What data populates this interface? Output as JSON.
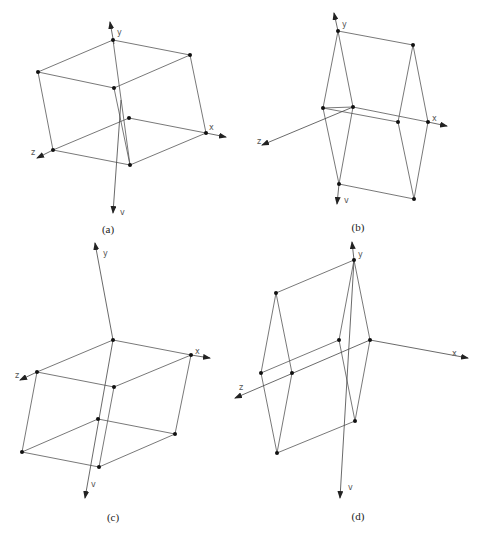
{
  "figure": {
    "panels": [
      {
        "id": "a",
        "caption": "(a)",
        "caption_pos": [
          108,
          233
        ],
        "axes": [
          {
            "name": "y",
            "label": "y",
            "from": [
              114,
              44
            ],
            "to": [
              110,
              22
            ],
            "label_pos": [
              117,
              35
            ]
          },
          {
            "name": "v",
            "label": "v",
            "from": [
              121,
              100
            ],
            "to": [
              113,
              213
            ],
            "label_pos": [
              120,
              215
            ]
          },
          {
            "name": "x",
            "label": "x",
            "from": [
              206,
              133
            ],
            "to": [
              226,
              137
            ],
            "label_pos": [
              209,
              130
            ]
          },
          {
            "name": "z",
            "label": "z",
            "from": [
              53,
              150
            ],
            "to": [
              37,
              158
            ],
            "label_pos": [
              31,
              155
            ]
          }
        ],
        "vertices": [
          [
            113,
            40
          ],
          [
            190,
            55
          ],
          [
            38,
            72
          ],
          [
            114,
            88
          ],
          [
            129,
            118
          ],
          [
            206,
            133
          ],
          [
            53,
            150
          ],
          [
            130,
            165
          ]
        ],
        "edges": [
          [
            0,
            1
          ],
          [
            0,
            2
          ],
          [
            1,
            3
          ],
          [
            2,
            3
          ],
          [
            4,
            5
          ],
          [
            4,
            6
          ],
          [
            5,
            7
          ],
          [
            6,
            7
          ],
          [
            0,
            7
          ],
          [
            1,
            5
          ],
          [
            2,
            6
          ],
          [
            3,
            7
          ]
        ]
      },
      {
        "id": "b",
        "caption": "(b)",
        "caption_pos": [
          358,
          231
        ],
        "axes": [
          {
            "name": "y",
            "label": "y",
            "from": [
              338,
              31
            ],
            "to": [
              334,
              13
            ],
            "label_pos": [
              342,
              27
            ]
          },
          {
            "name": "v",
            "label": "v",
            "from": [
              339,
              184
            ],
            "to": [
              337,
              204
            ],
            "label_pos": [
              344,
              203
            ]
          },
          {
            "name": "x",
            "label": "x",
            "from": [
              428,
              122
            ],
            "to": [
              447,
              126
            ],
            "label_pos": [
              432,
              121
            ]
          },
          {
            "name": "z",
            "label": "z",
            "from": [
              353,
              107
            ],
            "to": [
              262,
              145
            ],
            "label_pos": [
              257,
              144
            ]
          }
        ],
        "vertices": [
          [
            338,
            31
          ],
          [
            413,
            45
          ],
          [
            323,
            108
          ],
          [
            353,
            107
          ],
          [
            398,
            122
          ],
          [
            428,
            122
          ],
          [
            339,
            184
          ],
          [
            414,
            199
          ]
        ],
        "edges": [
          [
            0,
            1
          ],
          [
            0,
            2
          ],
          [
            0,
            3
          ],
          [
            1,
            4
          ],
          [
            1,
            5
          ],
          [
            2,
            3
          ],
          [
            2,
            6
          ],
          [
            3,
            6
          ],
          [
            2,
            4
          ],
          [
            3,
            5
          ],
          [
            4,
            7
          ],
          [
            5,
            7
          ],
          [
            6,
            7
          ]
        ]
      },
      {
        "id": "c",
        "caption": "(c)",
        "caption_pos": [
          113,
          521
        ],
        "axes": [
          {
            "name": "y",
            "label": "y",
            "from": [
              113,
              340
            ],
            "to": [
              95,
              243
            ],
            "label_pos": [
              103,
              256
            ]
          },
          {
            "name": "v",
            "label": "v",
            "from": [
              113,
              340
            ],
            "to": [
              85,
              498
            ],
            "label_pos": [
              91,
              487
            ]
          },
          {
            "name": "x",
            "label": "x",
            "from": [
              191,
              355
            ],
            "to": [
              210,
              358
            ],
            "label_pos": [
              195,
              354
            ]
          },
          {
            "name": "z",
            "label": "z",
            "from": [
              37,
              372
            ],
            "to": [
              20,
              380
            ],
            "label_pos": [
              15,
              378
            ]
          }
        ],
        "vertices": [
          [
            113,
            340
          ],
          [
            191,
            355
          ],
          [
            37,
            372
          ],
          [
            114,
            387
          ],
          [
            98,
            419
          ],
          [
            175,
            434
          ],
          [
            22,
            452
          ],
          [
            99,
            467
          ]
        ],
        "edges": [
          [
            0,
            1
          ],
          [
            0,
            2
          ],
          [
            1,
            3
          ],
          [
            2,
            3
          ],
          [
            4,
            5
          ],
          [
            4,
            6
          ],
          [
            5,
            7
          ],
          [
            6,
            7
          ],
          [
            1,
            5
          ],
          [
            2,
            6
          ],
          [
            3,
            7
          ]
        ]
      },
      {
        "id": "d",
        "caption": "(d)",
        "caption_pos": [
          358,
          520
        ],
        "axes": [
          {
            "name": "y",
            "label": "y",
            "from": [
              354,
              260
            ],
            "to": [
              352,
              242
            ],
            "label_pos": [
              358,
              257
            ]
          },
          {
            "name": "v",
            "label": "v",
            "from": [
              354,
              260
            ],
            "to": [
              340,
              498
            ],
            "label_pos": [
              348,
              490
            ]
          },
          {
            "name": "x",
            "label": "x",
            "from": [
              370,
              340
            ],
            "to": [
              468,
              358
            ],
            "label_pos": [
              452,
              356
            ]
          },
          {
            "name": "z",
            "label": "z",
            "from": [
              370,
              340
            ],
            "to": [
              235,
              398
            ],
            "label_pos": [
              239,
              390
            ]
          }
        ],
        "vertices": [
          [
            354,
            260
          ],
          [
            276,
            293
          ],
          [
            339,
            340
          ],
          [
            370,
            340
          ],
          [
            261,
            373
          ],
          [
            292,
            373
          ],
          [
            355,
            421
          ],
          [
            277,
            453
          ]
        ],
        "edges": [
          [
            0,
            1
          ],
          [
            0,
            2
          ],
          [
            0,
            3
          ],
          [
            1,
            4
          ],
          [
            1,
            5
          ],
          [
            2,
            4
          ],
          [
            2,
            6
          ],
          [
            3,
            6
          ],
          [
            4,
            7
          ],
          [
            5,
            7
          ],
          [
            6,
            7
          ]
        ]
      }
    ]
  }
}
